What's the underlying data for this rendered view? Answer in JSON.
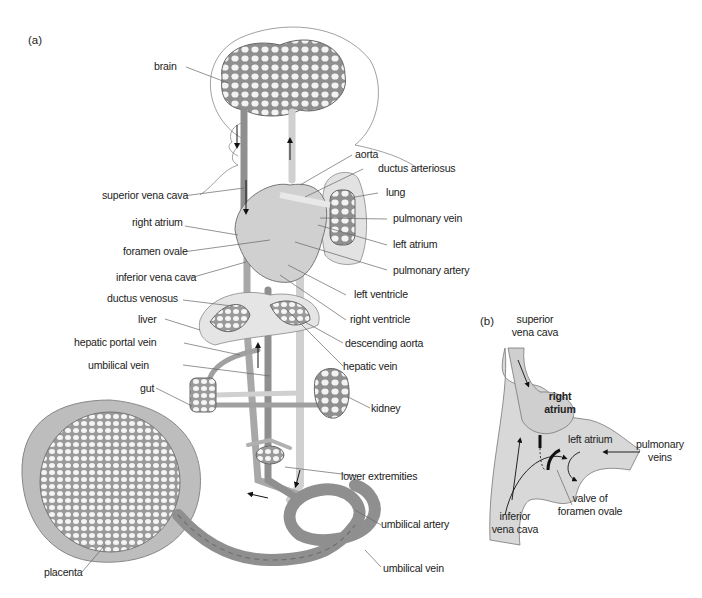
{
  "figure": {
    "panel_a": {
      "marker": "(a)",
      "labels": {
        "brain": "brain",
        "aorta": "aorta",
        "ductus_arteriosus": "ductus arteriosus",
        "lung": "lung",
        "superior_vena_cava": "superior vena cava",
        "pulmonary_vein": "pulmonary vein",
        "right_atrium": "right atrium",
        "left_atrium": "left atrium",
        "foramen_ovale": "foramen ovale",
        "pulmonary_artery": "pulmonary artery",
        "inferior_vena_cava": "inferior vena cava",
        "left_ventricle": "left ventricle",
        "ductus_venosus": "ductus venosus",
        "right_ventricle": "right ventricle",
        "liver": "liver",
        "descending_aorta": "descending aorta",
        "hepatic_portal_vein": "hepatic portal vein",
        "hepatic_vein": "hepatic vein",
        "umbilical_vein_upper": "umbilical vein",
        "gut": "gut",
        "kidney": "kidney",
        "lower_extremities": "lower extremities",
        "umbilical_artery": "umbilical artery",
        "placenta": "placenta",
        "umbilical_vein_lower": "umbilical vein"
      }
    },
    "panel_b": {
      "marker": "(b)",
      "labels": {
        "superior_vena_cava": "superior\nvena cava",
        "right_atrium": "right\natrium",
        "left_atrium": "left atrium",
        "pulmonary_veins": "pulmonary\nveins",
        "inferior_vena_cava": "inferior\nvena cava",
        "valve_of_foramen_ovale": "valve of\nforamen ovale"
      }
    },
    "colors": {
      "vessel_dark": "#8f8f8f",
      "vessel_light": "#d4d4d4",
      "tissue_fill": "#e6e6e6",
      "outline": "#555555",
      "text": "#222222",
      "leader": "#666666"
    }
  }
}
